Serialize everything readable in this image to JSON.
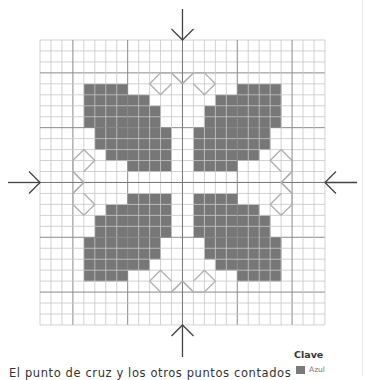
{
  "chart_data": {
    "type": "heatmap",
    "title": "",
    "grid": {
      "cols": 26,
      "rows": 26,
      "origin_px": [
        40,
        40
      ],
      "cell_px": 10.96,
      "major_every": 5,
      "major_offset": 3
    },
    "colors": {
      "filled": "#777777",
      "outline": "#b0b0b0",
      "grid_minor": "#c6c6c6",
      "grid_major": "#8a8a8a",
      "arrow": "#444444"
    },
    "filled_rows_top_left": [
      {
        "row": 4,
        "cols": [
          4,
          7
        ]
      },
      {
        "row": 5,
        "cols": [
          4,
          9
        ]
      },
      {
        "row": 6,
        "cols": [
          4,
          10
        ]
      },
      {
        "row": 7,
        "cols": [
          4,
          10
        ]
      },
      {
        "row": 8,
        "cols": [
          5,
          11
        ]
      },
      {
        "row": 9,
        "cols": [
          5,
          11
        ]
      },
      {
        "row": 10,
        "cols": [
          6,
          11
        ]
      },
      {
        "row": 11,
        "cols": [
          8,
          11
        ]
      }
    ],
    "symmetry": "mirrored horizontally and vertically about center (col/row 13)",
    "outline_motif_top": [
      [
        [
          10,
          4
        ],
        [
          11,
          3
        ],
        [
          12,
          3
        ],
        [
          13,
          4
        ]
      ],
      [
        [
          10,
          4
        ],
        [
          11,
          5
        ],
        [
          12,
          4
        ]
      ],
      [
        [
          12,
          3
        ],
        [
          13,
          4
        ],
        [
          14,
          3
        ]
      ],
      [
        [
          16,
          4
        ],
        [
          15,
          3
        ],
        [
          14,
          3
        ],
        [
          13,
          4
        ]
      ],
      [
        [
          16,
          4
        ],
        [
          15,
          5
        ],
        [
          14,
          4
        ]
      ]
    ],
    "center_arrows": [
      "top",
      "bottom",
      "left",
      "right"
    ]
  },
  "caption": "El punto de cruz y los otros puntos contados",
  "legend": {
    "title": "Clave",
    "items": [
      {
        "label": "Azul",
        "color": "#7a7a7a"
      }
    ]
  }
}
